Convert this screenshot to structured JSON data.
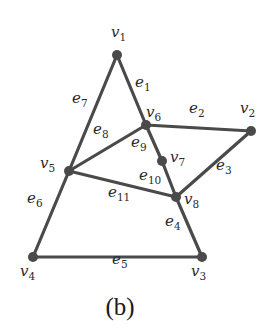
{
  "caption": "(b)",
  "colors": {
    "edge": "#4a4a4a",
    "node": "#4a4a4a",
    "text": "#2a2a2a"
  },
  "nodes": [
    {
      "id": "v1",
      "name": "v",
      "sub": "1",
      "x": 117,
      "y": 55,
      "lx": 111,
      "ly": 37
    },
    {
      "id": "v2",
      "name": "v",
      "sub": "2",
      "x": 251,
      "y": 131,
      "lx": 240,
      "ly": 113
    },
    {
      "id": "v3",
      "name": "v",
      "sub": "3",
      "x": 202,
      "y": 257,
      "lx": 191,
      "ly": 276
    },
    {
      "id": "v4",
      "name": "v",
      "sub": "4",
      "x": 33,
      "y": 257,
      "lx": 20,
      "ly": 276
    },
    {
      "id": "v5",
      "name": "v",
      "sub": "5",
      "x": 69,
      "y": 171,
      "lx": 40,
      "ly": 168
    },
    {
      "id": "v6",
      "name": "v",
      "sub": "6",
      "x": 146,
      "y": 125,
      "lx": 146,
      "ly": 117
    },
    {
      "id": "v7",
      "name": "v",
      "sub": "7",
      "x": 162,
      "y": 161,
      "lx": 170,
      "ly": 162
    },
    {
      "id": "v8",
      "name": "v",
      "sub": "8",
      "x": 176,
      "y": 197,
      "lx": 184,
      "ly": 204
    }
  ],
  "edges": [
    {
      "id": "e1",
      "name": "e",
      "sub": "1",
      "from": "v1",
      "to": "v6",
      "lx": 135,
      "ly": 87
    },
    {
      "id": "e2",
      "name": "e",
      "sub": "2",
      "from": "v6",
      "to": "v2",
      "lx": 189,
      "ly": 113
    },
    {
      "id": "e3",
      "name": "e",
      "sub": "3",
      "from": "v2",
      "to": "v8",
      "lx": 216,
      "ly": 170
    },
    {
      "id": "e4",
      "name": "e",
      "sub": "4",
      "from": "v8",
      "to": "v3",
      "lx": 165,
      "ly": 226
    },
    {
      "id": "e5",
      "name": "e",
      "sub": "5",
      "from": "v4",
      "to": "v3",
      "lx": 112,
      "ly": 264
    },
    {
      "id": "e6",
      "name": "e",
      "sub": "6",
      "from": "v5",
      "to": "v4",
      "lx": 27,
      "ly": 203
    },
    {
      "id": "e7",
      "name": "e",
      "sub": "7",
      "from": "v1",
      "to": "v5",
      "lx": 72,
      "ly": 103
    },
    {
      "id": "e8",
      "name": "e",
      "sub": "8",
      "from": "v5",
      "to": "v6",
      "lx": 93,
      "ly": 134
    },
    {
      "id": "e9",
      "name": "e",
      "sub": "9",
      "from": "v6",
      "to": "v7",
      "lx": 131,
      "ly": 147
    },
    {
      "id": "e10",
      "name": "e",
      "sub": "10",
      "from": "v7",
      "to": "v8",
      "lx": 139,
      "ly": 180
    },
    {
      "id": "e11",
      "name": "e",
      "sub": "11",
      "from": "v5",
      "to": "v8",
      "lx": 108,
      "ly": 197
    }
  ]
}
